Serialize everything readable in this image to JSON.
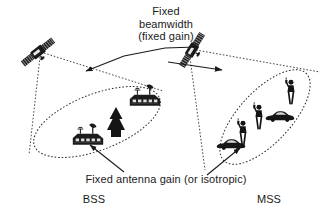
{
  "figure": {
    "name": "satellite-beam-coverage-diagram",
    "width": 332,
    "height": 215,
    "background_color": "#ffffff",
    "ink_color": "#1a1a1a"
  },
  "annotations": {
    "title_line1": "Fixed",
    "title_line2": "beamwidth",
    "title_line3": "(fixed gain)",
    "caption_gain": "Fixed antenna gain (or isotropic)"
  },
  "systems": [
    {
      "acronym": "BSS",
      "side": "left",
      "satellite_icon": "satellite-icon",
      "footprint_icon": "ellipse-footprint-icon",
      "terminals": [
        "house-with-dish-icon",
        "house-with-dish-icon",
        "tree-icon"
      ]
    },
    {
      "acronym": "MSS",
      "side": "right",
      "satellite_icon": "satellite-icon",
      "footprint_icon": "ellipse-footprint-icon",
      "terminals": [
        "car-icon",
        "car-icon",
        "person-handset-icon",
        "person-handset-icon",
        "person-handset-icon"
      ]
    }
  ],
  "labels": {
    "bss": "BSS",
    "mss": "MSS"
  },
  "colors": {
    "ink": "#1a1a1a",
    "beam_line": "#333333",
    "background": "#ffffff"
  }
}
